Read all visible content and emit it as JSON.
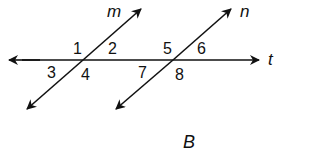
{
  "diagram": {
    "caption": "B",
    "lines": {
      "m": "m",
      "n": "n",
      "t": "t"
    },
    "angles": [
      "1",
      "2",
      "3",
      "4",
      "5",
      "6",
      "7",
      "8"
    ],
    "stroke_color": "#111111"
  }
}
